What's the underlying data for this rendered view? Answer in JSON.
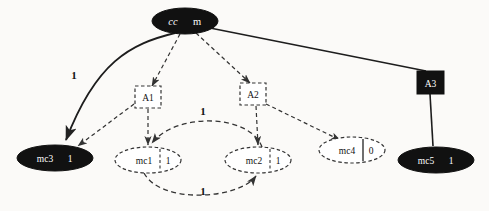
{
  "diagram": {
    "colors": {
      "filled": "#111111",
      "filled_text": "#ffffff",
      "outline": "#333333",
      "edge": "#333333",
      "background": "#fbfaf8"
    },
    "nodes": [
      {
        "id": "root",
        "shape": "ellipse",
        "style": "filled",
        "label": "cc",
        "value": "m",
        "divider": false,
        "cx": 185,
        "cy": 21,
        "rx": 33,
        "ry": 13
      },
      {
        "id": "a1",
        "shape": "box",
        "style": "dashed",
        "label": "A1",
        "value": "",
        "divider": false,
        "cx": 148,
        "cy": 97,
        "rx": 13,
        "ry": 11
      },
      {
        "id": "a2",
        "shape": "box",
        "style": "dashed",
        "label": "A2",
        "value": "",
        "divider": false,
        "cx": 253,
        "cy": 94,
        "rx": 13,
        "ry": 11
      },
      {
        "id": "a3",
        "shape": "box",
        "style": "filled",
        "label": "A3",
        "value": "",
        "divider": false,
        "cx": 430,
        "cy": 82,
        "rx": 13,
        "ry": 11
      },
      {
        "id": "mc3",
        "shape": "ellipse",
        "style": "filled",
        "label": "mc3",
        "value": "1",
        "divider": false,
        "cx": 55,
        "cy": 158,
        "rx": 38,
        "ry": 13
      },
      {
        "id": "mc1",
        "shape": "ellipse",
        "style": "dashed",
        "label": "mc1",
        "value": "1",
        "divider": true,
        "cx": 148,
        "cy": 160,
        "rx": 33,
        "ry": 13
      },
      {
        "id": "mc2",
        "shape": "ellipse",
        "style": "dashed",
        "label": "mc2",
        "value": "1",
        "divider": true,
        "cx": 258,
        "cy": 160,
        "rx": 33,
        "ry": 13
      },
      {
        "id": "mc4",
        "shape": "ellipse",
        "style": "dashed",
        "label": "mc4",
        "value": "0",
        "divider": true,
        "cx": 352,
        "cy": 150,
        "rx": 33,
        "ry": 13
      },
      {
        "id": "mc5",
        "shape": "ellipse",
        "style": "filled",
        "label": "mc5",
        "value": "1",
        "divider": false,
        "cx": 436,
        "cy": 160,
        "rx": 38,
        "ry": 13
      }
    ],
    "edges": [
      {
        "id": "root-mc3",
        "from": "root",
        "to": "mc3",
        "style": "solid",
        "label": "1",
        "label_x": 74,
        "label_y": 75
      },
      {
        "id": "root-a3",
        "from": "root",
        "to": "a3",
        "style": "solid",
        "label": "",
        "label_x": 0,
        "label_y": 0
      },
      {
        "id": "root-a1",
        "from": "root",
        "to": "a1",
        "style": "dashed",
        "label": "",
        "label_x": 0,
        "label_y": 0
      },
      {
        "id": "root-a2",
        "from": "root",
        "to": "a2",
        "style": "dashed",
        "label": "",
        "label_x": 0,
        "label_y": 0
      },
      {
        "id": "a1-mc3",
        "from": "a1",
        "to": "mc3",
        "style": "dashed",
        "label": "",
        "label_x": 0,
        "label_y": 0
      },
      {
        "id": "a1-mc1",
        "from": "a1",
        "to": "mc1",
        "style": "dashed",
        "label": "",
        "label_x": 0,
        "label_y": 0
      },
      {
        "id": "a2-mc2",
        "from": "a2",
        "to": "mc2",
        "style": "dashed",
        "label": "",
        "label_x": 0,
        "label_y": 0
      },
      {
        "id": "a2-mc4",
        "from": "a2",
        "to": "mc4",
        "style": "dashed",
        "label": "",
        "label_x": 0,
        "label_y": 0
      },
      {
        "id": "a3-mc5",
        "from": "a3",
        "to": "mc5",
        "style": "solid",
        "label": "",
        "label_x": 0,
        "label_y": 0
      },
      {
        "id": "mc2-mc1",
        "from": "mc2",
        "to": "mc1",
        "style": "dashed",
        "label": "1",
        "label_x": 203,
        "label_y": 111
      },
      {
        "id": "mc1-mc2",
        "from": "mc1",
        "to": "mc2",
        "style": "dashed",
        "label": "1",
        "label_x": 203,
        "label_y": 191
      }
    ]
  }
}
